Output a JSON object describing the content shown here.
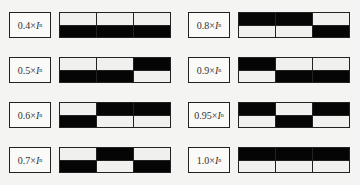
{
  "diagram": {
    "unit_symbol": "I",
    "unit_subscript": "n",
    "items": [
      {
        "coef": "0.4",
        "top": [
          0,
          0,
          0
        ],
        "bottom": [
          1,
          1,
          1
        ]
      },
      {
        "coef": "0.5",
        "top": [
          0,
          0,
          1
        ],
        "bottom": [
          1,
          1,
          0
        ]
      },
      {
        "coef": "0.6",
        "top": [
          0,
          1,
          1
        ],
        "bottom": [
          1,
          0,
          0
        ]
      },
      {
        "coef": "0.7",
        "top": [
          0,
          1,
          0
        ],
        "bottom": [
          1,
          0,
          1
        ]
      },
      {
        "coef": "0.8",
        "top": [
          1,
          1,
          0
        ],
        "bottom": [
          0,
          0,
          1
        ]
      },
      {
        "coef": "0.9",
        "top": [
          1,
          0,
          0
        ],
        "bottom": [
          0,
          1,
          1
        ]
      },
      {
        "coef": "0.95",
        "top": [
          1,
          0,
          1
        ],
        "bottom": [
          0,
          1,
          0
        ]
      },
      {
        "coef": "1.0",
        "top": [
          1,
          1,
          1
        ],
        "bottom": [
          0,
          0,
          0
        ]
      }
    ],
    "colors": {
      "on": "#050505",
      "off": "#f0f0ee",
      "border": "#222222"
    }
  }
}
